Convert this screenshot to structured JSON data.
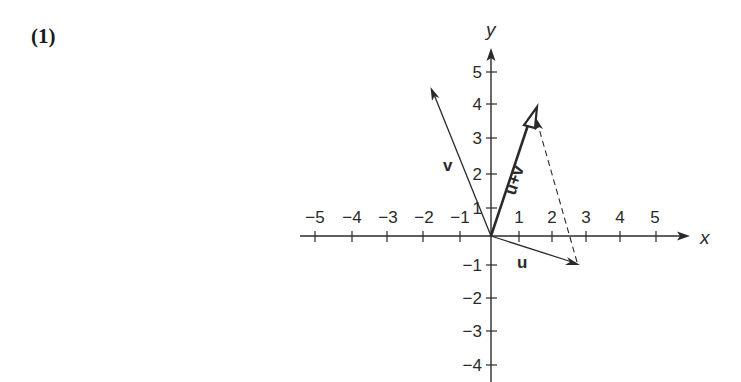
{
  "problem": {
    "number_label": "(1)"
  },
  "axes": {
    "x_label": "x",
    "y_label": "y",
    "x_ticks": [
      "−5",
      "−4",
      "−3",
      "−2",
      "−1",
      "1",
      "2",
      "3",
      "4",
      "5"
    ],
    "y_ticks_pos": [
      "5",
      "4",
      "3",
      "2",
      "1"
    ],
    "y_ticks_neg": [
      "−1",
      "−2",
      "−3",
      "−4"
    ]
  },
  "vectors": {
    "u": {
      "label": "u",
      "end": [
        2.7,
        -0.8
      ]
    },
    "v": {
      "label": "v",
      "end": [
        -1.8,
        4.5
      ]
    },
    "sum": {
      "label": "u+v",
      "end": [
        1.3,
        3.9
      ]
    }
  },
  "colors": {
    "ink": "#2a2a2a",
    "background": "#ffffff"
  }
}
